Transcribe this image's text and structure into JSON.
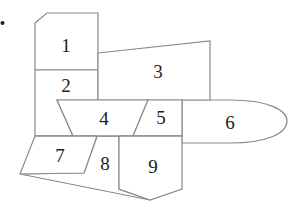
{
  "diagram": {
    "type": "region-map",
    "bullet": "•",
    "stroke_color": "#8a8a8a",
    "label_color": "#222222",
    "regions": [
      {
        "id": 1,
        "label": "1"
      },
      {
        "id": 2,
        "label": "2"
      },
      {
        "id": 3,
        "label": "3"
      },
      {
        "id": 4,
        "label": "4"
      },
      {
        "id": 5,
        "label": "5"
      },
      {
        "id": 6,
        "label": "6"
      },
      {
        "id": 7,
        "label": "7"
      },
      {
        "id": 8,
        "label": "8"
      },
      {
        "id": 9,
        "label": "9"
      }
    ]
  }
}
